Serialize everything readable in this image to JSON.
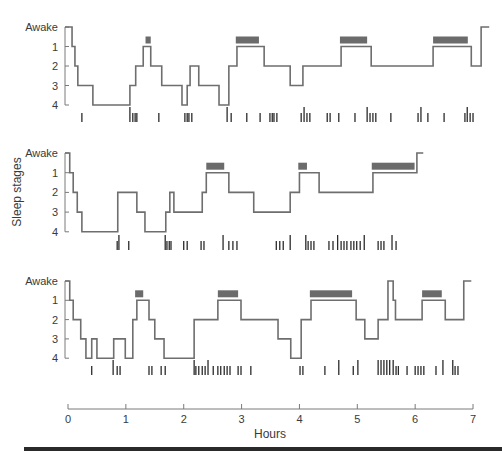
{
  "chart_data": {
    "type": "line",
    "subtype": "hypnogram-step",
    "title": "",
    "xlabel": "Hours",
    "ylabel": "Sleep stages",
    "xlim": [
      0,
      7
    ],
    "x_ticks": [
      0,
      1,
      2,
      3,
      4,
      5,
      6,
      7
    ],
    "y_tick_labels": [
      "Awake",
      "1",
      "2",
      "3",
      "4"
    ],
    "y_levels": {
      "Awake": 0,
      "1": 1,
      "2": 2,
      "3": 3,
      "4": 4
    },
    "grid": false,
    "legend": null,
    "annotations": {
      "rem_bars": "dark gray bars above stage-1 periods mark REM sleep",
      "tick_rows": "vertical tick marks below each hypnogram mark body movements (tall ticks = larger movements)"
    },
    "panels": [
      {
        "name": "Night 1",
        "segments": [
          {
            "start": 0.0,
            "end": 0.07,
            "stage": "Awake"
          },
          {
            "start": 0.07,
            "end": 0.12,
            "stage": "1"
          },
          {
            "start": 0.12,
            "end": 0.17,
            "stage": "2"
          },
          {
            "start": 0.17,
            "end": 0.43,
            "stage": "3"
          },
          {
            "start": 0.43,
            "end": 1.07,
            "stage": "4"
          },
          {
            "start": 1.07,
            "end": 1.17,
            "stage": "3"
          },
          {
            "start": 1.17,
            "end": 1.3,
            "stage": "2"
          },
          {
            "start": 1.3,
            "end": 1.43,
            "stage": "1"
          },
          {
            "start": 1.43,
            "end": 1.62,
            "stage": "2"
          },
          {
            "start": 1.62,
            "end": 1.97,
            "stage": "3"
          },
          {
            "start": 1.97,
            "end": 2.06,
            "stage": "4"
          },
          {
            "start": 2.06,
            "end": 2.11,
            "stage": "3"
          },
          {
            "start": 2.11,
            "end": 2.26,
            "stage": "2"
          },
          {
            "start": 2.26,
            "end": 2.61,
            "stage": "3"
          },
          {
            "start": 2.61,
            "end": 2.78,
            "stage": "4"
          },
          {
            "start": 2.78,
            "end": 2.92,
            "stage": "2"
          },
          {
            "start": 2.92,
            "end": 3.39,
            "stage": "1"
          },
          {
            "start": 3.39,
            "end": 3.84,
            "stage": "2"
          },
          {
            "start": 3.84,
            "end": 4.06,
            "stage": "3"
          },
          {
            "start": 4.06,
            "end": 4.72,
            "stage": "2"
          },
          {
            "start": 4.72,
            "end": 5.24,
            "stage": "1"
          },
          {
            "start": 5.24,
            "end": 6.31,
            "stage": "2"
          },
          {
            "start": 6.31,
            "end": 6.97,
            "stage": "1"
          },
          {
            "start": 6.97,
            "end": 7.14,
            "stage": "2"
          },
          {
            "start": 7.14,
            "end": 7.28,
            "stage": "Awake"
          }
        ],
        "rem": [
          [
            1.34,
            1.43
          ],
          [
            2.9,
            3.3
          ],
          [
            4.7,
            5.17
          ],
          [
            6.31,
            6.91
          ]
        ],
        "movements": [
          {
            "t": 0.24,
            "tall": false
          },
          {
            "t": 1.07,
            "tall": true
          },
          {
            "t": 1.12,
            "tall": false
          },
          {
            "t": 1.16,
            "tall": false
          },
          {
            "t": 1.19,
            "tall": false
          },
          {
            "t": 1.57,
            "tall": false
          },
          {
            "t": 2.02,
            "tall": false
          },
          {
            "t": 2.06,
            "tall": false
          },
          {
            "t": 2.09,
            "tall": false
          },
          {
            "t": 2.14,
            "tall": false
          },
          {
            "t": 2.75,
            "tall": true
          },
          {
            "t": 2.82,
            "tall": false
          },
          {
            "t": 3.09,
            "tall": false
          },
          {
            "t": 3.32,
            "tall": false
          },
          {
            "t": 3.49,
            "tall": false
          },
          {
            "t": 3.53,
            "tall": false
          },
          {
            "t": 3.56,
            "tall": false
          },
          {
            "t": 3.61,
            "tall": false
          },
          {
            "t": 4.03,
            "tall": false
          },
          {
            "t": 4.08,
            "tall": true
          },
          {
            "t": 4.13,
            "tall": false
          },
          {
            "t": 4.18,
            "tall": false
          },
          {
            "t": 4.48,
            "tall": false
          },
          {
            "t": 4.53,
            "tall": false
          },
          {
            "t": 4.68,
            "tall": false
          },
          {
            "t": 4.96,
            "tall": false
          },
          {
            "t": 5.17,
            "tall": true
          },
          {
            "t": 5.22,
            "tall": false
          },
          {
            "t": 5.27,
            "tall": false
          },
          {
            "t": 5.32,
            "tall": false
          },
          {
            "t": 5.58,
            "tall": false
          },
          {
            "t": 6.05,
            "tall": false
          },
          {
            "t": 6.1,
            "tall": true
          },
          {
            "t": 6.22,
            "tall": false
          },
          {
            "t": 6.5,
            "tall": false
          },
          {
            "t": 6.86,
            "tall": false
          },
          {
            "t": 6.9,
            "tall": true
          },
          {
            "t": 6.95,
            "tall": false
          },
          {
            "t": 7.0,
            "tall": false
          }
        ]
      },
      {
        "name": "Night 2",
        "segments": [
          {
            "start": 0.0,
            "end": 0.03,
            "stage": "Awake"
          },
          {
            "start": 0.03,
            "end": 0.09,
            "stage": "1"
          },
          {
            "start": 0.09,
            "end": 0.16,
            "stage": "2"
          },
          {
            "start": 0.16,
            "end": 0.24,
            "stage": "3"
          },
          {
            "start": 0.24,
            "end": 0.86,
            "stage": "4"
          },
          {
            "start": 0.86,
            "end": 1.19,
            "stage": "2"
          },
          {
            "start": 1.19,
            "end": 1.33,
            "stage": "3"
          },
          {
            "start": 1.33,
            "end": 1.69,
            "stage": "4"
          },
          {
            "start": 1.69,
            "end": 1.76,
            "stage": "3"
          },
          {
            "start": 1.76,
            "end": 1.83,
            "stage": "2"
          },
          {
            "start": 1.83,
            "end": 2.32,
            "stage": "3"
          },
          {
            "start": 2.32,
            "end": 2.39,
            "stage": "2"
          },
          {
            "start": 2.39,
            "end": 2.78,
            "stage": "1"
          },
          {
            "start": 2.78,
            "end": 3.21,
            "stage": "2"
          },
          {
            "start": 3.21,
            "end": 3.84,
            "stage": "3"
          },
          {
            "start": 3.84,
            "end": 4.0,
            "stage": "2"
          },
          {
            "start": 4.0,
            "end": 4.34,
            "stage": "1"
          },
          {
            "start": 4.34,
            "end": 5.27,
            "stage": "2"
          },
          {
            "start": 5.27,
            "end": 6.03,
            "stage": "1"
          },
          {
            "start": 6.03,
            "end": 6.14,
            "stage": "Awake"
          }
        ],
        "rem": [
          [
            2.39,
            2.7
          ],
          [
            3.98,
            4.13
          ],
          [
            5.25,
            5.99
          ]
        ],
        "movements": [
          {
            "t": 0.85,
            "tall": false
          },
          {
            "t": 0.88,
            "tall": true
          },
          {
            "t": 1.05,
            "tall": false
          },
          {
            "t": 1.68,
            "tall": true
          },
          {
            "t": 1.71,
            "tall": false
          },
          {
            "t": 1.75,
            "tall": false
          },
          {
            "t": 1.78,
            "tall": false
          },
          {
            "t": 2.0,
            "tall": false
          },
          {
            "t": 2.06,
            "tall": false
          },
          {
            "t": 2.3,
            "tall": false
          },
          {
            "t": 2.35,
            "tall": false
          },
          {
            "t": 2.68,
            "tall": true
          },
          {
            "t": 2.78,
            "tall": false
          },
          {
            "t": 2.85,
            "tall": false
          },
          {
            "t": 2.92,
            "tall": false
          },
          {
            "t": 3.6,
            "tall": false
          },
          {
            "t": 3.66,
            "tall": false
          },
          {
            "t": 3.72,
            "tall": false
          },
          {
            "t": 3.84,
            "tall": true
          },
          {
            "t": 4.11,
            "tall": true
          },
          {
            "t": 4.15,
            "tall": false
          },
          {
            "t": 4.2,
            "tall": false
          },
          {
            "t": 4.25,
            "tall": false
          },
          {
            "t": 4.51,
            "tall": false
          },
          {
            "t": 4.58,
            "tall": false
          },
          {
            "t": 4.66,
            "tall": true
          },
          {
            "t": 4.72,
            "tall": false
          },
          {
            "t": 4.77,
            "tall": false
          },
          {
            "t": 4.82,
            "tall": false
          },
          {
            "t": 4.89,
            "tall": false
          },
          {
            "t": 4.94,
            "tall": false
          },
          {
            "t": 4.99,
            "tall": false
          },
          {
            "t": 5.05,
            "tall": false
          },
          {
            "t": 5.12,
            "tall": true
          },
          {
            "t": 5.36,
            "tall": false
          },
          {
            "t": 5.41,
            "tall": false
          },
          {
            "t": 5.46,
            "tall": false
          },
          {
            "t": 5.6,
            "tall": true
          },
          {
            "t": 5.67,
            "tall": false
          }
        ]
      },
      {
        "name": "Night 3",
        "segments": [
          {
            "start": 0.0,
            "end": 0.03,
            "stage": "Awake"
          },
          {
            "start": 0.03,
            "end": 0.09,
            "stage": "1"
          },
          {
            "start": 0.09,
            "end": 0.22,
            "stage": "2"
          },
          {
            "start": 0.22,
            "end": 0.31,
            "stage": "3"
          },
          {
            "start": 0.31,
            "end": 0.41,
            "stage": "4"
          },
          {
            "start": 0.41,
            "end": 0.5,
            "stage": "3"
          },
          {
            "start": 0.5,
            "end": 0.79,
            "stage": "4"
          },
          {
            "start": 0.79,
            "end": 0.99,
            "stage": "3"
          },
          {
            "start": 0.99,
            "end": 1.12,
            "stage": "4"
          },
          {
            "start": 1.12,
            "end": 1.19,
            "stage": "2"
          },
          {
            "start": 1.19,
            "end": 1.4,
            "stage": "1"
          },
          {
            "start": 1.4,
            "end": 1.5,
            "stage": "2"
          },
          {
            "start": 1.5,
            "end": 1.66,
            "stage": "3"
          },
          {
            "start": 1.66,
            "end": 2.18,
            "stage": "4"
          },
          {
            "start": 2.18,
            "end": 2.59,
            "stage": "2"
          },
          {
            "start": 2.59,
            "end": 2.99,
            "stage": "1"
          },
          {
            "start": 2.99,
            "end": 3.63,
            "stage": "2"
          },
          {
            "start": 3.63,
            "end": 3.85,
            "stage": "3"
          },
          {
            "start": 3.85,
            "end": 4.03,
            "stage": "4"
          },
          {
            "start": 4.03,
            "end": 4.2,
            "stage": "2"
          },
          {
            "start": 4.2,
            "end": 4.98,
            "stage": "1"
          },
          {
            "start": 4.98,
            "end": 5.13,
            "stage": "2"
          },
          {
            "start": 5.13,
            "end": 5.36,
            "stage": "3"
          },
          {
            "start": 5.36,
            "end": 5.53,
            "stage": "2"
          },
          {
            "start": 5.53,
            "end": 5.62,
            "stage": "Awake"
          },
          {
            "start": 5.62,
            "end": 5.66,
            "stage": "1"
          },
          {
            "start": 5.66,
            "end": 6.12,
            "stage": "2"
          },
          {
            "start": 6.12,
            "end": 6.52,
            "stage": "1"
          },
          {
            "start": 6.52,
            "end": 6.84,
            "stage": "2"
          },
          {
            "start": 6.84,
            "end": 6.97,
            "stage": "Awake"
          }
        ],
        "rem": [
          [
            1.16,
            1.3
          ],
          [
            2.59,
            2.94
          ],
          [
            4.18,
            4.91
          ],
          [
            6.12,
            6.46
          ]
        ],
        "movements": [
          {
            "t": 0.41,
            "tall": false
          },
          {
            "t": 0.78,
            "tall": true
          },
          {
            "t": 0.85,
            "tall": false
          },
          {
            "t": 0.9,
            "tall": false
          },
          {
            "t": 1.4,
            "tall": false
          },
          {
            "t": 1.45,
            "tall": false
          },
          {
            "t": 1.61,
            "tall": false
          },
          {
            "t": 1.68,
            "tall": false
          },
          {
            "t": 2.18,
            "tall": true
          },
          {
            "t": 2.21,
            "tall": false
          },
          {
            "t": 2.26,
            "tall": false
          },
          {
            "t": 2.32,
            "tall": false
          },
          {
            "t": 2.37,
            "tall": false
          },
          {
            "t": 2.42,
            "tall": true
          },
          {
            "t": 2.51,
            "tall": false
          },
          {
            "t": 2.59,
            "tall": false
          },
          {
            "t": 2.64,
            "tall": false
          },
          {
            "t": 2.7,
            "tall": false
          },
          {
            "t": 2.75,
            "tall": false
          },
          {
            "t": 2.8,
            "tall": false
          },
          {
            "t": 2.94,
            "tall": false
          },
          {
            "t": 2.99,
            "tall": false
          },
          {
            "t": 3.16,
            "tall": false
          },
          {
            "t": 4.01,
            "tall": false
          },
          {
            "t": 4.06,
            "tall": false
          },
          {
            "t": 4.44,
            "tall": false
          },
          {
            "t": 4.68,
            "tall": true
          },
          {
            "t": 4.93,
            "tall": false
          },
          {
            "t": 5.01,
            "tall": true
          },
          {
            "t": 5.36,
            "tall": true
          },
          {
            "t": 5.41,
            "tall": true
          },
          {
            "t": 5.46,
            "tall": true
          },
          {
            "t": 5.51,
            "tall": true
          },
          {
            "t": 5.56,
            "tall": true
          },
          {
            "t": 5.62,
            "tall": true
          },
          {
            "t": 5.67,
            "tall": false
          },
          {
            "t": 5.71,
            "tall": false
          },
          {
            "t": 5.86,
            "tall": false
          },
          {
            "t": 6.0,
            "tall": false
          },
          {
            "t": 6.05,
            "tall": false
          },
          {
            "t": 6.1,
            "tall": false
          },
          {
            "t": 6.15,
            "tall": false
          },
          {
            "t": 6.36,
            "tall": false
          },
          {
            "t": 6.48,
            "tall": true
          },
          {
            "t": 6.65,
            "tall": true
          },
          {
            "t": 6.69,
            "tall": false
          },
          {
            "t": 6.74,
            "tall": false
          }
        ]
      }
    ]
  },
  "axis": {
    "ylabel": "Sleep stages",
    "xlabel": "Hours",
    "y_tick_labels": [
      "Awake",
      "1",
      "2",
      "3",
      "4"
    ],
    "x_tick_labels": [
      "0",
      "1",
      "2",
      "3",
      "4",
      "5",
      "6",
      "7"
    ]
  },
  "colors": {
    "line": "#6e6e6e",
    "rem_bar": "#6b6b6b",
    "ticks": "#2b2b2b",
    "axis": "#7a7a7a",
    "text": "#3a3a3a",
    "bottom_band": "#2a2a2a"
  }
}
